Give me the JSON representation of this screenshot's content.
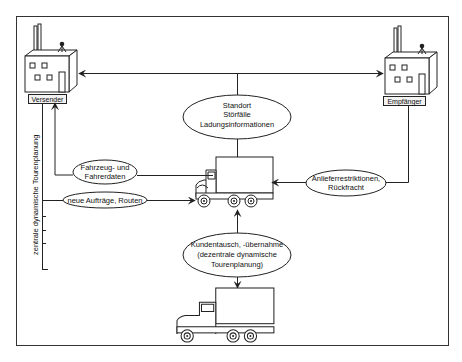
{
  "diagram": {
    "nodes": {
      "shipper": {
        "label": "Versender",
        "icon": "factory-icon"
      },
      "receiver": {
        "label": "Empfänger",
        "icon": "factory-icon"
      },
      "central_truck": {
        "icon": "truck-icon"
      },
      "other_truck": {
        "icon": "truck-icon"
      }
    },
    "ellipses": {
      "status": {
        "lines": [
          "Standort",
          "Störfälle",
          "Ladungsinformationen"
        ]
      },
      "vehicle_data": {
        "lines": [
          "Fahrzeug- und",
          "Fahrerdaten"
        ]
      },
      "new_orders": {
        "lines": [
          "neue Aufträge, Routen"
        ]
      },
      "delivery": {
        "lines": [
          "Anlieferrestriktionen,",
          "Rückfracht"
        ]
      },
      "customer_exchange": {
        "lines": [
          "Kundentausch, -übernahme",
          "(dezentrale dynamische",
          "Tourenplanung)"
        ]
      }
    },
    "side_label": "zentrale dynamische Tourenplanung",
    "colors": {
      "line": "#222222",
      "background": "#ffffff"
    }
  }
}
